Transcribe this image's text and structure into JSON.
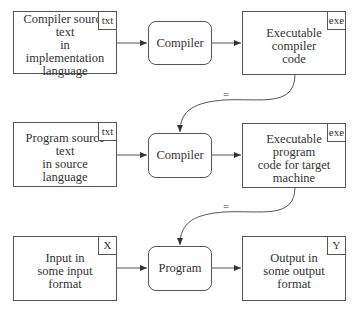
{
  "diagram": {
    "rows": [
      {
        "input": {
          "label": "Compiler source text\nin implementation\nlanguage",
          "tag": "txt"
        },
        "process": {
          "label": "Compiler"
        },
        "output": {
          "label": "Executable compiler\ncode",
          "tag": "exe"
        }
      },
      {
        "input": {
          "label": "Program source text\nin source language",
          "tag": "txt"
        },
        "process": {
          "label": "Compiler"
        },
        "output": {
          "label": "Executable program\ncode for target\nmachine",
          "tag": "exe"
        }
      },
      {
        "input": {
          "label": "Input in\nsome input format",
          "tag": "X"
        },
        "process": {
          "label": "Program"
        },
        "output": {
          "label": "Output in\nsome output format",
          "tag": "Y"
        }
      }
    ],
    "connectors": [
      {
        "from": "rows.0.output",
        "to": "rows.1.process",
        "label": "="
      },
      {
        "from": "rows.1.output",
        "to": "rows.2.process",
        "label": "="
      }
    ],
    "colors": {
      "stroke": "#555555",
      "text": "#333333",
      "background": "#ffffff"
    }
  }
}
